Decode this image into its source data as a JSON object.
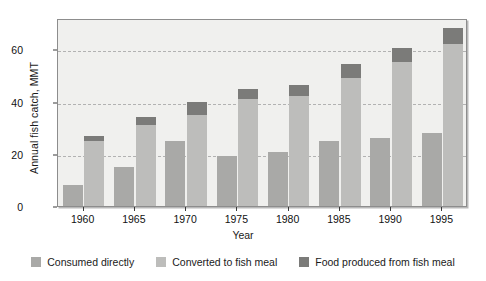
{
  "chart_data": {
    "type": "bar",
    "title": "",
    "xlabel": "Year",
    "ylabel": "Annual fish catch, MMT",
    "categories": [
      "1960",
      "1965",
      "1970",
      "1975",
      "1980",
      "1985",
      "1990",
      "1995"
    ],
    "ylim": [
      0,
      72
    ],
    "yticks": [
      0,
      20,
      40,
      60
    ],
    "ytick_labels": [
      "0",
      "20",
      "40",
      "60"
    ],
    "grid": "horizontal-dashed",
    "legend_position": "bottom-center",
    "note": "Each year shows two adjacent bars: a 'Consumed directly' bar, and a stacked bar whose lower light segment is 'Converted to fish meal' and whose dark cap top equals 'Food produced from fish meal' total.",
    "series": [
      {
        "name": "Consumed directly",
        "color": "#a9a9a7",
        "values": [
          8,
          15,
          25,
          19,
          20.5,
          25,
          26,
          28
        ]
      },
      {
        "name": "Converted to fish meal",
        "color": "#bdbdbb",
        "values": [
          25,
          31,
          35,
          41,
          42,
          49,
          55,
          62
        ]
      },
      {
        "name": "Food produced from fish meal",
        "color": "#7b7b79",
        "values": [
          27,
          34,
          40,
          45,
          46.5,
          54.5,
          60.5,
          68
        ]
      }
    ]
  },
  "legend": {
    "items": [
      {
        "label": "Consumed directly",
        "color": "#a9a9a7"
      },
      {
        "label": "Converted to fish meal",
        "color": "#bdbdbb"
      },
      {
        "label": "Food produced from fish meal",
        "color": "#7b7b79"
      }
    ]
  },
  "colors": {
    "plot_background": "#f0f0ee",
    "frame": "#8d8d8d",
    "gridline": "#b2b2b2",
    "text": "#1a1a1a"
  }
}
